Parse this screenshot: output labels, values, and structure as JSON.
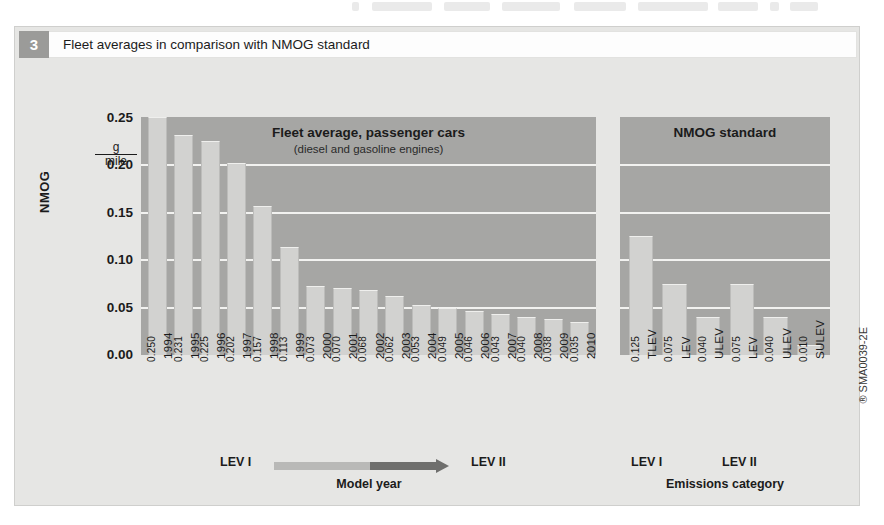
{
  "figure": {
    "number": "3",
    "caption": "Fleet averages in comparison with NMOG standard",
    "source_code": "SMA0039-2E"
  },
  "axes": {
    "y_title": "NMOG",
    "y_unit_numerator": "g",
    "y_unit_denominator": "mile",
    "y_ticks": [
      "0.25",
      "0.20",
      "0.15",
      "0.10",
      "0.05",
      "0.00"
    ],
    "left_axis_caption": "Model year",
    "right_axis_caption": "Emissions category",
    "lev_start_label": "LEV I",
    "lev_end_label": "LEV II",
    "right_group_left_label": "LEV I",
    "right_group_right_label": "LEV II"
  },
  "panels": {
    "left": {
      "title": "Fleet average, passenger cars",
      "subtitle": "(diesel and gasoline engines)"
    },
    "right": {
      "title": "NMOG standard"
    }
  },
  "colors": {
    "panel_fill": "#a6a6a4",
    "bar_fill": "#d2d2d0",
    "gridline": "#f2f2f0",
    "badge": "#9b9b99",
    "figure_bg": "#e6e6e4",
    "arrow_light": "#b9b9b7",
    "arrow_dark": "#6f6f6d"
  },
  "chart_data": {
    "type": "bar",
    "title": "Fleet averages in comparison with NMOG standard",
    "xlabel": "Model year / Emissions category",
    "ylabel": "NMOG",
    "yunit": "g/mile",
    "ylim": [
      0,
      0.25
    ],
    "yticks": [
      0.0,
      0.05,
      0.1,
      0.15,
      0.2,
      0.25
    ],
    "grid": true,
    "legend": "none",
    "panels": [
      {
        "name": "Fleet average, passenger cars",
        "subtitle": "(diesel and gasoline engines)",
        "categories": [
          "1994",
          "1995",
          "1996",
          "1997",
          "1998",
          "1999",
          "2000",
          "2001",
          "2002",
          "2003",
          "2004",
          "2005",
          "2006",
          "2007",
          "2008",
          "2009",
          "2010"
        ],
        "values": [
          0.25,
          0.231,
          0.225,
          0.202,
          0.157,
          0.113,
          0.073,
          0.07,
          0.068,
          0.062,
          0.053,
          0.049,
          0.046,
          0.043,
          0.04,
          0.038,
          0.035
        ],
        "labels": [
          "0.250",
          "0.231",
          "0.225",
          "0.202",
          "0.157",
          "0.113",
          "0.073",
          "0.070",
          "0.068",
          "0.062",
          "0.053",
          "0.049",
          "0.046",
          "0.043",
          "0.040",
          "0.038",
          "0.035"
        ]
      },
      {
        "name": "NMOG standard",
        "categories": [
          "TLEV",
          "LEV",
          "ULEV",
          "LEV",
          "ULEV",
          "SULEV"
        ],
        "values": [
          0.125,
          0.075,
          0.04,
          0.075,
          0.04,
          0.01
        ],
        "labels": [
          "0.125",
          "0.075",
          "0.040",
          "0.075",
          "0.040",
          "0.010"
        ],
        "groups": [
          {
            "label": "LEV I",
            "categories": [
              "TLEV",
              "LEV",
              "ULEV"
            ]
          },
          {
            "label": "LEV II",
            "categories": [
              "LEV",
              "ULEV",
              "SULEV"
            ]
          }
        ]
      }
    ]
  }
}
